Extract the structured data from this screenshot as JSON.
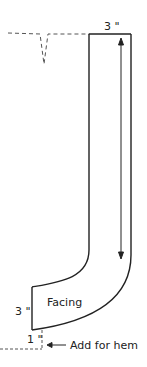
{
  "diagram": {
    "type": "sewing-pattern-facing",
    "labels": {
      "top_width": "3 \"",
      "bottom_width": "3 \"",
      "piece_name": "Facing",
      "hem_allowance": "1 \"",
      "hem_note": "Add for hem"
    },
    "colors": {
      "stroke": "#222222",
      "dashed": "#555555",
      "background": "#ffffff"
    }
  }
}
